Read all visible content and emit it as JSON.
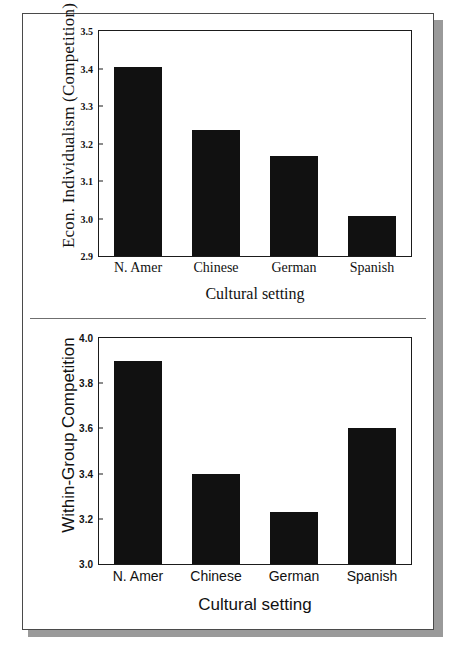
{
  "figure": {
    "background": "#ffffff",
    "frame_border_color": "#4a4a4a",
    "frame_shadow_color": "#9a9a9a",
    "bar_color": "#111111",
    "axis_color": "#1b1b1b",
    "caption_partial": ""
  },
  "chart_data": [
    {
      "type": "bar",
      "panel": "top",
      "title": "",
      "categories": [
        "N. Amer",
        "Chinese",
        "German",
        "Spanish"
      ],
      "values": [
        3.405,
        3.235,
        3.167,
        3.008
      ],
      "xlabel": "Cultural setting",
      "ylabel": "Econ. Individualism (Competition)",
      "ylim": [
        2.9,
        3.5
      ],
      "yticks": [
        2.9,
        3.0,
        3.1,
        3.2,
        3.3,
        3.4,
        3.5
      ],
      "ytick_labels": [
        "2.9",
        "3.0",
        "3.1",
        "3.2",
        "3.3",
        "3.4",
        "3.5"
      ],
      "grid": false,
      "legend": false
    },
    {
      "type": "bar",
      "panel": "bottom",
      "title": "",
      "categories": [
        "N. Amer",
        "Chinese",
        "German",
        "Spanish"
      ],
      "values": [
        3.9,
        3.4,
        3.23,
        3.6
      ],
      "xlabel": "Cultural setting",
      "ylabel": "Within-Group Competition",
      "ylim": [
        3.0,
        4.0
      ],
      "yticks": [
        3.0,
        3.2,
        3.4,
        3.6,
        3.8,
        4.0
      ],
      "ytick_labels": [
        "3.0",
        "3.2",
        "3.4",
        "3.6",
        "3.8",
        "4.0"
      ],
      "grid": false,
      "legend": false
    }
  ]
}
